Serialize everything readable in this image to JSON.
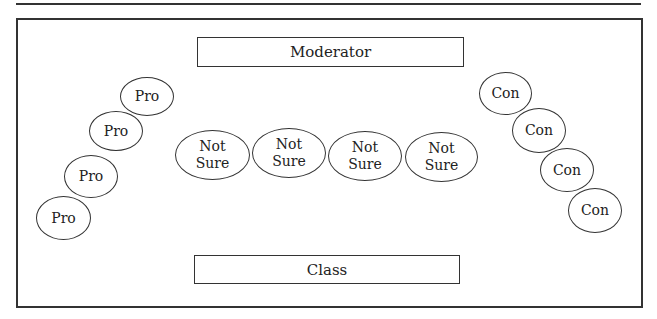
{
  "diagram": {
    "type": "debate seating arrangement",
    "moderator_label": "Moderator",
    "class_label": "Class",
    "pro": [
      {
        "label": "Pro",
        "cx": 147,
        "cy": 96
      },
      {
        "label": "Pro",
        "cx": 116,
        "cy": 131
      },
      {
        "label": "Pro",
        "cx": 91,
        "cy": 176
      },
      {
        "label": "Pro",
        "cx": 63,
        "cy": 217
      }
    ],
    "not_sure": [
      {
        "line1": "Not",
        "line2": "Sure",
        "cx": 212,
        "cy": 155
      },
      {
        "line1": "Not",
        "line2": "Sure",
        "cx": 289,
        "cy": 153
      },
      {
        "line1": "Not",
        "line2": "Sure",
        "cx": 365,
        "cy": 156
      },
      {
        "line1": "Not",
        "line2": "Sure",
        "cx": 441,
        "cy": 157
      }
    ],
    "con": [
      {
        "label": "Con",
        "cx": 506,
        "cy": 93
      },
      {
        "label": "Con",
        "cx": 539,
        "cy": 130
      },
      {
        "label": "Con",
        "cx": 567,
        "cy": 170
      },
      {
        "label": "Con",
        "cx": 595,
        "cy": 210
      }
    ]
  }
}
